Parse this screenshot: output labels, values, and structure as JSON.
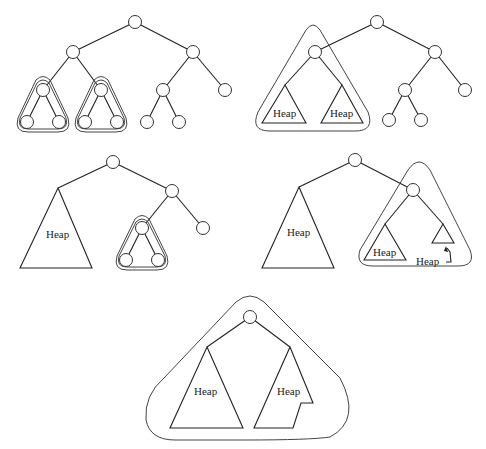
{
  "diagram": {
    "label": "Heap",
    "panels": [
      {
        "name": "stage-1",
        "description": "Complete binary tree; two bottom-left 3-node subtrees outlined"
      },
      {
        "name": "stage-2",
        "description": "Left subtree of root outlined; its children are Heaps"
      },
      {
        "name": "stage-3",
        "description": "Left subtree is a Heap; a 3-node subtree on the right is outlined"
      },
      {
        "name": "stage-4",
        "description": "Left subtree Heap; right subtree outlined containing two Heaps, one small with arrow label"
      },
      {
        "name": "stage-5",
        "description": "Whole tree outlined: root with two Heap subtrees"
      }
    ],
    "labels": {
      "p2_left": "Heap",
      "p2_right": "Heap",
      "p3_left": "Heap",
      "p4_left": "Heap",
      "p4_inner_left": "Heap",
      "p4_inner_right_callout": "Heap",
      "p5_left": "Heap",
      "p5_right": "Heap"
    }
  }
}
